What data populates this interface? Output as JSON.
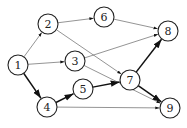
{
  "diagram": {
    "type": "directed-graph",
    "nodes": [
      {
        "id": "1",
        "label": "1",
        "x": 18,
        "y": 65
      },
      {
        "id": "2",
        "label": "2",
        "x": 48,
        "y": 24
      },
      {
        "id": "3",
        "label": "3",
        "x": 75,
        "y": 61
      },
      {
        "id": "4",
        "label": "4",
        "x": 47,
        "y": 107
      },
      {
        "id": "5",
        "label": "5",
        "x": 83,
        "y": 89
      },
      {
        "id": "6",
        "label": "6",
        "x": 104,
        "y": 17
      },
      {
        "id": "7",
        "label": "7",
        "x": 130,
        "y": 80
      },
      {
        "id": "8",
        "label": "8",
        "x": 168,
        "y": 31
      },
      {
        "id": "9",
        "label": "9",
        "x": 170,
        "y": 108
      }
    ],
    "edges": [
      {
        "from": "1",
        "to": "2",
        "weight": "thin"
      },
      {
        "from": "1",
        "to": "3",
        "weight": "thin"
      },
      {
        "from": "1",
        "to": "4",
        "weight": "thick"
      },
      {
        "from": "2",
        "to": "6",
        "weight": "thin"
      },
      {
        "from": "2",
        "to": "7",
        "weight": "thin"
      },
      {
        "from": "3",
        "to": "8",
        "weight": "thin"
      },
      {
        "from": "3",
        "to": "9",
        "weight": "thin"
      },
      {
        "from": "4",
        "to": "5",
        "weight": "thick"
      },
      {
        "from": "4",
        "to": "9",
        "weight": "thin"
      },
      {
        "from": "5",
        "to": "7",
        "weight": "thick"
      },
      {
        "from": "6",
        "to": "8",
        "weight": "thin"
      },
      {
        "from": "7",
        "to": "8",
        "weight": "thick"
      },
      {
        "from": "7",
        "to": "9",
        "weight": "thick"
      }
    ],
    "node_radius": 10
  }
}
